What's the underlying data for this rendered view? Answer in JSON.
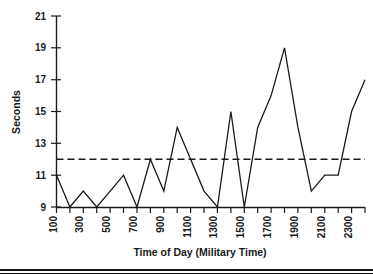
{
  "chart_data": {
    "type": "line",
    "title": "",
    "xlabel": "Time of Day (Military Time)",
    "ylabel": "Seconds",
    "xlim": [
      100,
      2400
    ],
    "ylim": [
      9,
      21
    ],
    "yticks": [
      9,
      11,
      13,
      15,
      17,
      19,
      21
    ],
    "ytick_labels": [
      "9",
      "11",
      "13",
      "15",
      "17",
      "19",
      "21"
    ],
    "xticks": [
      100,
      200,
      300,
      400,
      500,
      600,
      700,
      800,
      900,
      1000,
      1100,
      1200,
      1300,
      1400,
      1500,
      1600,
      1700,
      1800,
      1900,
      2000,
      2100,
      2200,
      2300,
      2400
    ],
    "xtick_labels": [
      "100",
      "",
      "300",
      "",
      "500",
      "",
      "700",
      "",
      "900",
      "",
      "1100",
      "",
      "1300",
      "",
      "1500",
      "",
      "1700",
      "",
      "1900",
      "",
      "2100",
      "",
      "2300",
      ""
    ],
    "grid": false,
    "legend": "none",
    "x": [
      100,
      200,
      300,
      400,
      500,
      600,
      700,
      800,
      900,
      1000,
      1100,
      1200,
      1300,
      1400,
      1500,
      1600,
      1700,
      1800,
      1900,
      2000,
      2100,
      2200,
      2300,
      2400
    ],
    "values": [
      11,
      9,
      10,
      9,
      10,
      11,
      9,
      12,
      10,
      14,
      12,
      10,
      9,
      15,
      9,
      14,
      16,
      19,
      14,
      10,
      11,
      11,
      15,
      17
    ],
    "series": [
      {
        "name": "Seconds",
        "color": "#1a1a1a",
        "style": "solid",
        "values": [
          11,
          9,
          10,
          9,
          10,
          11,
          9,
          12,
          10,
          14,
          12,
          10,
          9,
          15,
          9,
          14,
          16,
          19,
          14,
          10,
          11,
          11,
          15,
          17
        ]
      }
    ],
    "reference_lines": [
      {
        "name": "mean-line",
        "orientation": "horizontal",
        "value": 12,
        "style": "dashed",
        "color": "#1a1a1a"
      }
    ],
    "annotations": []
  },
  "axes": {
    "y_title": "Seconds",
    "x_title": "Time of Day (Military Time)"
  }
}
